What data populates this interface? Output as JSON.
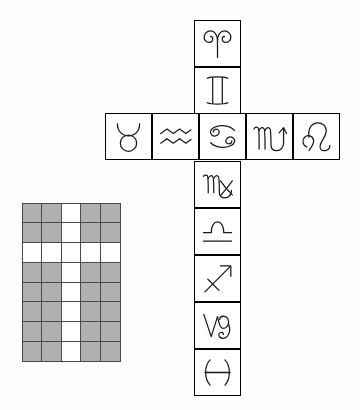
{
  "figure": {
    "background_color": "#fdfdfd",
    "stroke_color": "#1a1a1a",
    "box_border_color": "#000000"
  },
  "grid": {
    "name": "shaded-grid",
    "columns": 5,
    "rows": 8,
    "shaded_color": "#b0b0b0",
    "blank_color": "#ffffff",
    "border_color": "#4a4a4a",
    "x": 22,
    "y": 203,
    "width": 98,
    "height": 158,
    "cells": [
      [
        "shaded",
        "shaded",
        "blank",
        "shaded",
        "shaded"
      ],
      [
        "shaded",
        "shaded",
        "blank",
        "shaded",
        "shaded"
      ],
      [
        "blank",
        "blank",
        "blank",
        "blank",
        "blank"
      ],
      [
        "shaded",
        "shaded",
        "blank",
        "shaded",
        "shaded"
      ],
      [
        "shaded",
        "shaded",
        "blank",
        "shaded",
        "shaded"
      ],
      [
        "shaded",
        "shaded",
        "blank",
        "shaded",
        "shaded"
      ],
      [
        "shaded",
        "shaded",
        "blank",
        "shaded",
        "shaded"
      ],
      [
        "shaded",
        "shaded",
        "blank",
        "shaded",
        "shaded"
      ]
    ]
  },
  "cross": {
    "name": "zodiac-cross",
    "cell_size": 47,
    "column_x": 194,
    "row_y": 113,
    "vertical_top_y": 20,
    "horizontal_left_x": 105,
    "vertical_cells": [
      {
        "sign": "aries",
        "glyph": "aries-glyph",
        "row": 0
      },
      {
        "sign": "gemini",
        "glyph": "gemini-glyph",
        "row": 1
      },
      {
        "sign": "cancer",
        "glyph": "cancer-glyph",
        "row": 2
      },
      {
        "sign": "virgo",
        "glyph": "virgo-glyph",
        "row": 3
      },
      {
        "sign": "libra",
        "glyph": "libra-glyph",
        "row": 4
      },
      {
        "sign": "sagittarius",
        "glyph": "sagittarius-glyph",
        "row": 5
      },
      {
        "sign": "capricorn",
        "glyph": "capricorn-glyph",
        "row": 6
      },
      {
        "sign": "pisces",
        "glyph": "pisces-glyph",
        "row": 7
      }
    ],
    "horizontal_cells": [
      {
        "sign": "taurus",
        "glyph": "taurus-glyph",
        "col": 0
      },
      {
        "sign": "aquarius",
        "glyph": "aquarius-glyph",
        "col": 1
      },
      {
        "sign": "cancer",
        "glyph": "cancer-glyph",
        "col": 2
      },
      {
        "sign": "scorpio",
        "glyph": "scorpio-glyph",
        "col": 3
      },
      {
        "sign": "leo",
        "glyph": "leo-glyph",
        "col": 4
      }
    ]
  }
}
